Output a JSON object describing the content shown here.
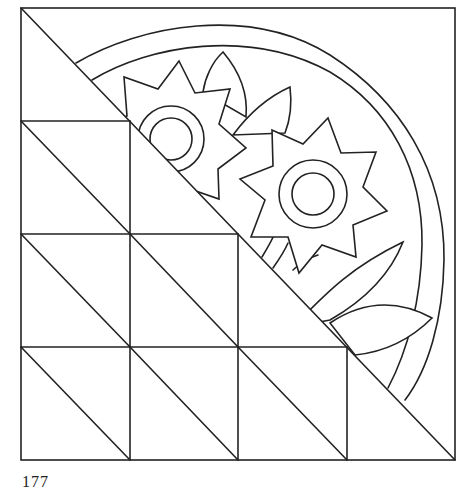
{
  "figure": {
    "stroke_color": "#222222",
    "background_color": "#ffffff",
    "grid": {
      "columns": 4,
      "rows": 4
    },
    "elements": [
      "outer-square-frame",
      "grid-lines",
      "main-diagonal",
      "half-square-triangles",
      "quarter-arc-outer",
      "quarter-arc-inner",
      "sunflower-left",
      "sunflower-right",
      "leaves",
      "stems"
    ]
  },
  "footer": {
    "page_number": "177"
  }
}
